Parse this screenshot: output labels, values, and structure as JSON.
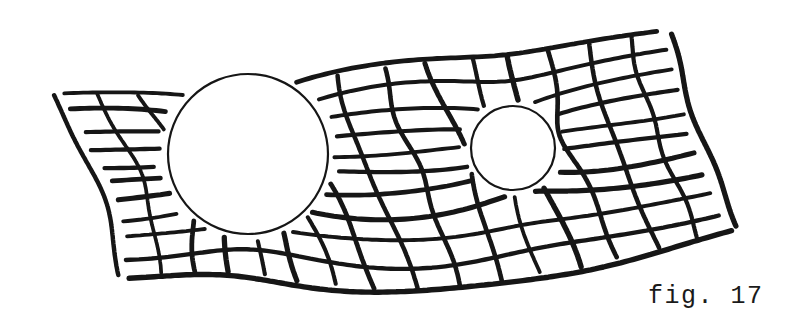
{
  "figure": {
    "caption": "fig. 17",
    "background_color": "#ffffff",
    "ink_color": "#161616",
    "canvas": {
      "width": 792,
      "height": 334
    }
  },
  "diagram": {
    "kind": "hand-drawn-line-illustration",
    "grid": {
      "stroke_color": "#161616",
      "stroke_width": 4.4,
      "u_line_count": 17,
      "v_line_count": 11,
      "cell_size_px": 37,
      "style": "wobbly hand-drawn strokes with broken ends"
    },
    "circles": [
      {
        "name": "large-mass-circle",
        "center_x": 248,
        "center_y": 154,
        "radius": 80,
        "stroke_color": "#161616",
        "stroke_width": 2.2,
        "fill": "#ffffff"
      },
      {
        "name": "small-mass-circle",
        "center_x": 513,
        "center_y": 148,
        "radius": 42,
        "stroke_color": "#161616",
        "stroke_width": 2.2,
        "fill": "#ffffff"
      }
    ]
  }
}
